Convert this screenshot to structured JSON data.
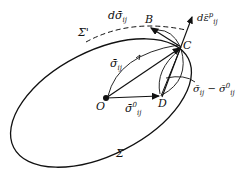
{
  "diagram": {
    "points": {
      "O": "O",
      "B": "B",
      "C": "C",
      "D": "D"
    },
    "surfaces": {
      "initial": "Σ",
      "subsequent": "Σ'"
    },
    "vectors": {
      "sigma_bar": "σ̄",
      "sigma_bar_sub": "ij",
      "sigma0": "σ̄",
      "sigma0_sup": "0",
      "sigma0_sub": "ij",
      "d_sigma": "dσ̄",
      "d_sigma_sub": "ij",
      "d_eps": "dε̄",
      "d_eps_sup": "p",
      "d_eps_sub": "ij",
      "diff": "σ̄",
      "diff_sub": "ij",
      "diff_mid": " − σ̄",
      "diff_sup": "0",
      "diff_sub2": "ij"
    },
    "colors": {
      "stroke": "#111111",
      "background": "#ffffff"
    }
  }
}
